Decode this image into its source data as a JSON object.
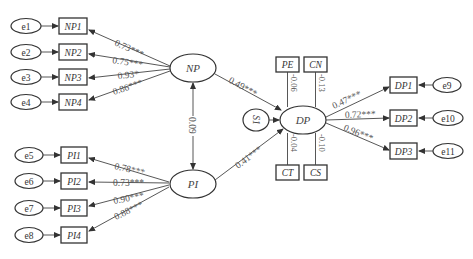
{
  "diagram": {
    "type": "structural-equation-model",
    "latent_variables": [
      {
        "id": "NP",
        "label": "NP"
      },
      {
        "id": "PI",
        "label": "PI"
      },
      {
        "id": "DP",
        "label": "DP"
      },
      {
        "id": "S1",
        "label": "S1"
      }
    ],
    "np_indicators": [
      {
        "error": "e1",
        "label": "NP1",
        "loading": "0.73***"
      },
      {
        "error": "e2",
        "label": "NP2",
        "loading": "0.75***"
      },
      {
        "error": "e3",
        "label": "NP3",
        "loading": "0.93*"
      },
      {
        "error": "e4",
        "label": "NP4",
        "loading": "0.86***"
      }
    ],
    "pi_indicators": [
      {
        "error": "e5",
        "label": "PI1",
        "loading": "0.78***"
      },
      {
        "error": "e6",
        "label": "PI2",
        "loading": "0.73***"
      },
      {
        "error": "e7",
        "label": "PI3",
        "loading": "0.90***"
      },
      {
        "error": "e8",
        "label": "PI4",
        "loading": "0.88***"
      }
    ],
    "dp_indicators": [
      {
        "error": "e9",
        "label": "DP1",
        "loading": "0.47***"
      },
      {
        "error": "e10",
        "label": "DP2",
        "loading": "0.72***"
      },
      {
        "error": "e11",
        "label": "DP3",
        "loading": "0.96***"
      }
    ],
    "controls": [
      {
        "label": "PE",
        "coef": "-0.06"
      },
      {
        "label": "CN",
        "coef": "-0.13"
      },
      {
        "label": "CT",
        "coef": "-0.04"
      },
      {
        "label": "CS",
        "coef": "-0.10"
      }
    ],
    "paths": {
      "np_to_dp": "0.49***",
      "pi_to_dp": "0.41***",
      "np_pi_covariance": "0.09"
    }
  }
}
